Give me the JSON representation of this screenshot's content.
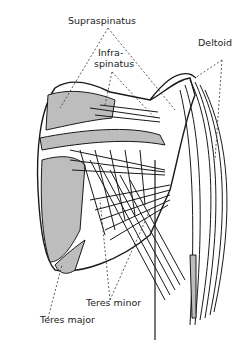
{
  "diagram": {
    "labels": {
      "supraspinatus": "Supraspinatus",
      "infraspinatus_line1": "Infra-",
      "infraspinatus_line2": "spinatus",
      "deltoid": "Deltoid",
      "teres_minor": "Teres minor",
      "teres_major": "Teres major"
    },
    "colors": {
      "line": "#1a1a1a",
      "fill_gray": "#bdbdbd",
      "background": "#ffffff"
    }
  }
}
